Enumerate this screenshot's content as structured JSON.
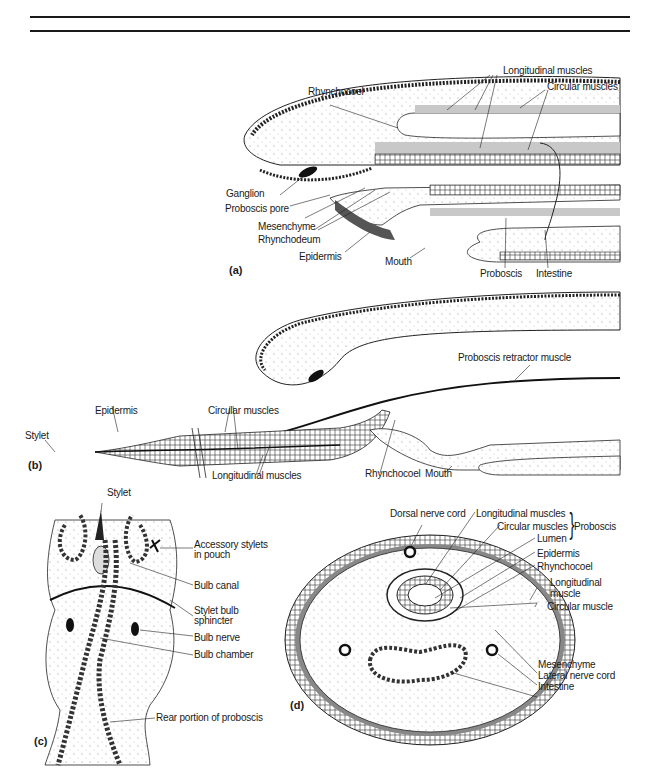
{
  "figure": {
    "panels": [
      {
        "id": "a",
        "label": "(a)"
      },
      {
        "id": "b",
        "label": "(b)"
      },
      {
        "id": "c",
        "label": "(c)"
      },
      {
        "id": "d",
        "label": "(d)"
      }
    ]
  },
  "panel_a": {
    "label": "(a)",
    "labels": {
      "rhynchocoel": "Rhynchocoel",
      "longitudinal_muscles": "Longitudinal muscles",
      "circular_muscles": "Circular muscles",
      "ganglion": "Ganglion",
      "proboscis_pore": "Proboscis pore",
      "mesenchyme": "Mesenchyme",
      "rhynchodeum": "Rhynchodeum",
      "epidermis": "Epidermis",
      "mouth": "Mouth",
      "proboscis": "Proboscis",
      "intestine": "Intestine"
    }
  },
  "panel_b": {
    "label": "(b)",
    "labels": {
      "proboscis_retractor_muscle": "Proboscis retractor muscle",
      "epidermis": "Epidermis",
      "circular_muscles": "Circular muscles",
      "stylet": "Stylet",
      "longitudinal_muscles": "Longitudinal muscles",
      "rhynchocoel": "Rhynchocoel",
      "mouth": "Mouth"
    }
  },
  "panel_c": {
    "label": "(c)",
    "labels": {
      "stylet": "Stylet",
      "accessory_stylets_1": "Accessory stylets",
      "accessory_stylets_2": "in pouch",
      "bulb_canal": "Bulb canal",
      "stylet_bulb_sphincter_1": "Stylet bulb",
      "stylet_bulb_sphincter_2": "sphincter",
      "bulb_nerve": "Bulb  nerve",
      "bulb_chamber": "Bulb chamber",
      "rear_portion": "Rear portion of proboscis"
    }
  },
  "panel_d": {
    "label": "(d)",
    "labels": {
      "dorsal_nerve_cord": "Dorsal nerve cord",
      "longitudinal_muscles": "Longitudinal  muscles",
      "circular_muscles": "Circular muscles",
      "lumen": "Lumen",
      "proboscis_group": "Proboscis",
      "epidermis": "Epidermis",
      "rhynchocoel": "Rhynchocoel",
      "longitudinal_muscle_1": "Longitudinal",
      "longitudinal_muscle_2": "muscle",
      "circular_muscle": "Circular muscle",
      "mesenchyme": "Mesenchyme",
      "lateral_nerve_cord": "Lateral nerve cord",
      "intestine": "Intestine"
    }
  }
}
